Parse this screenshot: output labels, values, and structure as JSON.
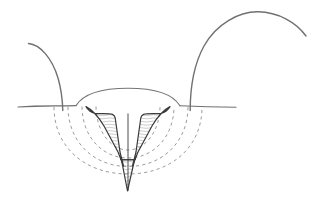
{
  "figure": {
    "title": "Cross-section line drawing of skin with a V-shaped incision and two hair shafts",
    "type": "medical-line-diagram",
    "width": 317,
    "height": 199,
    "background_color": "#ffffff"
  },
  "colors": {
    "outline": "#6b6b6b",
    "incision_outline": "#3a3a3a",
    "dashed_arc": "#8a8a8a",
    "hatching": "#9a9a9a",
    "hair": "#707070",
    "skin_line": "#6f6f6f",
    "dome_outline": "#767676"
  },
  "strokes": {
    "skin_line_width": 1.1,
    "hair_width": 1.4,
    "incision_width": 1.2,
    "dashed_width": 0.85,
    "dome_width": 1.1,
    "hatch_width": 0.5,
    "dash_pattern": "3.2 3.2"
  },
  "elements": {
    "skin_surface_left": {
      "label": "skin surface line, left segment",
      "path": "M 18 107 C 40 105.5, 58 106.2, 76 105.6"
    },
    "skin_surface_right": {
      "label": "skin surface line, right segment",
      "path": "M 180 105.8 C 200 106.6, 218 107.0, 236 107.2"
    },
    "dome": {
      "label": "raised dome of tissue above skin line",
      "path": "M 76 105.6 C 84 92.6, 106 88.2, 128 88.2 C 150 88.2, 172 92.6, 180 105.8"
    },
    "hair_left": {
      "label": "left hair shaft, short curved",
      "path": "M 28.5 43.5 C 40 44.5, 52 58, 58 78 C 61.5 90, 62.5 100, 62.8 110.5"
    },
    "hair_right": {
      "label": "right hair shaft, long arcing",
      "path": "M 190.2 110.5 C 190.2 92, 193 66, 204 46 C 216 24, 239 11.5, 258 11.8 C 278 12.2, 296 22, 306 36"
    },
    "incision_left_wedge": {
      "label": "left tissue wedge of V incision",
      "path": "M 86 106.6 C 88 110, 90 112, 95 113.4 L 110 113.8 C 113 113.8, 114.5 115.4, 115.2 118 L 120 152 L 123.5 166 L 118 152 L 104 126 C 96 112.5, 90 108.6, 86 106.6 Z"
    },
    "incision_right_wedge": {
      "label": "right tissue wedge of V incision",
      "path": "M 170 106.6 C 168 110, 166 112, 161 113.4 L 146 113.8 C 143 113.8, 141.5 115.4, 140.8 118 L 136 152 L 132.5 166 L 138 152 L 152 126 C 160 112.5, 166 108.6, 170 106.6 Z"
    },
    "incision_tip": {
      "label": "deep tapering tip of incision below arcs",
      "path": "M 121.5 160 L 127.5 191 L 134.5 160 Z"
    },
    "center_cleft": {
      "label": "central cleft line between wedges",
      "path": "M 128 113.8 L 128 190.5"
    },
    "dashed_arcs": [
      {
        "label": "innermost dashed arc",
        "path": "M 96 106.5 C 96 130, 110 150, 128 150 C 146 150, 160 130, 160 106.5"
      },
      {
        "label": "middle dashed arc",
        "path": "M 82 106.5 C 82 136, 102 158, 128 158 C 154 158, 174 136, 174 106.5"
      },
      {
        "label": "outer dashed arc",
        "path": "M 68 106.8 C 68 142, 94 166.5, 128 166.5 C 162 166.5, 188 142, 188 106.8"
      },
      {
        "label": "outermost dashed arc",
        "path": "M 54 107 C 54 148, 86 174, 128 174 C 170 174, 202 148, 202 107"
      }
    ],
    "hatch_lines_left": {
      "label": "horizontal hatching inside left wedge",
      "count": 18
    },
    "hatch_lines_right": {
      "label": "horizontal hatching inside right wedge",
      "count": 18
    },
    "base_marker": {
      "label": "small horizontal marker at base of incision",
      "path": "M 120.5 159.5 L 135.5 159.5"
    }
  }
}
